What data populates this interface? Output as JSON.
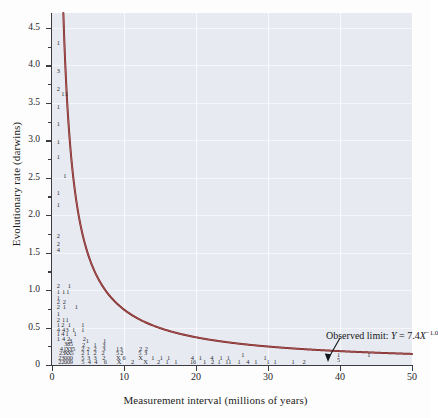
{
  "chart_data": {
    "type": "scatter",
    "title": "",
    "xlabel": "Measurement interval (millions of years)",
    "ylabel": "Evolutionary rate (darwins)",
    "xlim": [
      0,
      50
    ],
    "ylim": [
      0,
      4.7
    ],
    "xticks": [
      0,
      10,
      20,
      30,
      40,
      50
    ],
    "xticklabels": [
      "0",
      "10",
      "20",
      "30",
      "40",
      "50"
    ],
    "yticks": [
      0,
      0.5,
      1.0,
      1.5,
      2.0,
      2.5,
      3.0,
      3.5,
      4.0,
      4.5
    ],
    "yticklabels": [
      "0",
      "0.5",
      "1.0",
      "1.5",
      "2.0",
      "2.5",
      "3.0",
      "3.5",
      "4.0",
      "4.5"
    ],
    "y_minor_ticks": [
      0.25,
      0.75,
      1.25,
      1.75,
      2.25,
      2.75,
      3.25,
      3.75,
      4.25
    ],
    "grid": true,
    "grid_color": "#ffffff",
    "plot_background": "#e7ebf1",
    "curve": {
      "label": "Observed limit",
      "equation": "Y = 7.4X−1.0",
      "coefficient": 7.4,
      "exponent": -1.0,
      "color": "#7b1f1f"
    },
    "annotation": {
      "prefix": "Observed limit: ",
      "var_y": "Y",
      "eq": " = 7.4",
      "var_x": "X",
      "exponent": "−1.0",
      "arrow_target_x": 31.5,
      "arrow_target_y": 0.3
    },
    "point_glyph_note": "Each plotted symbol is a digit giving the number of coincident observations; 'X' denotes 10.",
    "points": [
      {
        "x": 0.9,
        "y": 4.3,
        "n": "1"
      },
      {
        "x": 0.9,
        "y": 3.92,
        "n": "3"
      },
      {
        "x": 0.9,
        "y": 3.68,
        "n": "2"
      },
      {
        "x": 1.5,
        "y": 3.62,
        "n": "1"
      },
      {
        "x": 2.0,
        "y": 3.62,
        "n": "1"
      },
      {
        "x": 0.9,
        "y": 3.45,
        "n": "1"
      },
      {
        "x": 0.9,
        "y": 3.22,
        "n": "1"
      },
      {
        "x": 0.9,
        "y": 2.98,
        "n": "1"
      },
      {
        "x": 0.9,
        "y": 2.78,
        "n": "1"
      },
      {
        "x": 1.8,
        "y": 2.52,
        "n": "1"
      },
      {
        "x": 0.9,
        "y": 2.3,
        "n": "1"
      },
      {
        "x": 0.9,
        "y": 2.13,
        "n": "1"
      },
      {
        "x": 0.9,
        "y": 1.72,
        "n": "2"
      },
      {
        "x": 0.9,
        "y": 1.62,
        "n": "2"
      },
      {
        "x": 0.9,
        "y": 1.53,
        "n": "4"
      },
      {
        "x": 0.9,
        "y": 1.06,
        "n": "2"
      },
      {
        "x": 2.4,
        "y": 1.06,
        "n": "1"
      },
      {
        "x": 0.9,
        "y": 0.98,
        "n": "1"
      },
      {
        "x": 1.6,
        "y": 0.98,
        "n": "1"
      },
      {
        "x": 2.2,
        "y": 0.98,
        "n": "1"
      },
      {
        "x": 0.9,
        "y": 0.9,
        "n": "1"
      },
      {
        "x": 0.9,
        "y": 0.84,
        "n": "2"
      },
      {
        "x": 1.7,
        "y": 0.84,
        "n": "2"
      },
      {
        "x": 0.9,
        "y": 0.78,
        "n": "2"
      },
      {
        "x": 1.7,
        "y": 0.78,
        "n": "1"
      },
      {
        "x": 3.4,
        "y": 0.77,
        "n": "1"
      },
      {
        "x": 0.9,
        "y": 0.68,
        "n": "1"
      },
      {
        "x": 0.9,
        "y": 0.6,
        "n": "2"
      },
      {
        "x": 1.6,
        "y": 0.6,
        "n": "1"
      },
      {
        "x": 2.1,
        "y": 0.6,
        "n": "1"
      },
      {
        "x": 0.9,
        "y": 0.53,
        "n": "1"
      },
      {
        "x": 1.5,
        "y": 0.53,
        "n": "2"
      },
      {
        "x": 2.4,
        "y": 0.53,
        "n": "1"
      },
      {
        "x": 4.3,
        "y": 0.53,
        "n": "1"
      },
      {
        "x": 0.9,
        "y": 0.47,
        "n": "4"
      },
      {
        "x": 1.6,
        "y": 0.47,
        "n": "4"
      },
      {
        "x": 2.1,
        "y": 0.47,
        "n": "3"
      },
      {
        "x": 3.0,
        "y": 0.47,
        "n": "1"
      },
      {
        "x": 4.3,
        "y": 0.47,
        "n": "1"
      },
      {
        "x": 0.9,
        "y": 0.41,
        "n": "1"
      },
      {
        "x": 1.5,
        "y": 0.41,
        "n": "4"
      },
      {
        "x": 2.1,
        "y": 0.41,
        "n": "1"
      },
      {
        "x": 3.2,
        "y": 0.41,
        "n": "1"
      },
      {
        "x": 0.9,
        "y": 0.35,
        "n": "1"
      },
      {
        "x": 1.6,
        "y": 0.35,
        "n": "4"
      },
      {
        "x": 2.3,
        "y": 0.35,
        "n": "2"
      },
      {
        "x": 4.5,
        "y": 0.35,
        "n": "2"
      },
      {
        "x": 2.6,
        "y": 0.32,
        "n": "3"
      },
      {
        "x": 4.9,
        "y": 0.32,
        "n": "1"
      },
      {
        "x": 7.3,
        "y": 0.32,
        "n": "1"
      },
      {
        "x": 1.9,
        "y": 0.28,
        "n": "3"
      },
      {
        "x": 2.3,
        "y": 0.28,
        "n": "8"
      },
      {
        "x": 2.7,
        "y": 0.28,
        "n": "5"
      },
      {
        "x": 4.4,
        "y": 0.27,
        "n": "2"
      },
      {
        "x": 6.0,
        "y": 0.27,
        "n": "1"
      },
      {
        "x": 7.2,
        "y": 0.27,
        "n": "3"
      },
      {
        "x": 1.3,
        "y": 0.22,
        "n": "4"
      },
      {
        "x": 1.8,
        "y": 0.22,
        "n": "1"
      },
      {
        "x": 2.2,
        "y": 0.22,
        "n": "X"
      },
      {
        "x": 2.6,
        "y": 0.22,
        "n": "3"
      },
      {
        "x": 3.0,
        "y": 0.22,
        "n": "5"
      },
      {
        "x": 4.3,
        "y": 0.22,
        "n": "2"
      },
      {
        "x": 5.0,
        "y": 0.22,
        "n": "2"
      },
      {
        "x": 6.0,
        "y": 0.22,
        "n": "2"
      },
      {
        "x": 7.2,
        "y": 0.22,
        "n": "3"
      },
      {
        "x": 9.1,
        "y": 0.22,
        "n": "1"
      },
      {
        "x": 9.6,
        "y": 0.22,
        "n": "3"
      },
      {
        "x": 12.3,
        "y": 0.22,
        "n": "2"
      },
      {
        "x": 13.1,
        "y": 0.22,
        "n": "2"
      },
      {
        "x": 1.2,
        "y": 0.16,
        "n": "2"
      },
      {
        "x": 1.6,
        "y": 0.16,
        "n": "3"
      },
      {
        "x": 2.0,
        "y": 0.16,
        "n": "X"
      },
      {
        "x": 2.4,
        "y": 0.16,
        "n": "X"
      },
      {
        "x": 2.8,
        "y": 0.16,
        "n": "5"
      },
      {
        "x": 4.3,
        "y": 0.16,
        "n": "2"
      },
      {
        "x": 5.0,
        "y": 0.16,
        "n": "1"
      },
      {
        "x": 6.0,
        "y": 0.16,
        "n": "2"
      },
      {
        "x": 7.1,
        "y": 0.16,
        "n": "2"
      },
      {
        "x": 9.1,
        "y": 0.16,
        "n": "5"
      },
      {
        "x": 9.7,
        "y": 0.16,
        "n": "2"
      },
      {
        "x": 12.2,
        "y": 0.16,
        "n": "5"
      },
      {
        "x": 13.0,
        "y": 0.16,
        "n": "3"
      },
      {
        "x": 1.1,
        "y": 0.1,
        "n": "2"
      },
      {
        "x": 1.5,
        "y": 0.1,
        "n": "3"
      },
      {
        "x": 1.9,
        "y": 0.1,
        "n": "0"
      },
      {
        "x": 2.3,
        "y": 0.1,
        "n": "0"
      },
      {
        "x": 2.7,
        "y": 0.1,
        "n": "0"
      },
      {
        "x": 4.3,
        "y": 0.1,
        "n": "5"
      },
      {
        "x": 5.1,
        "y": 0.1,
        "n": "3"
      },
      {
        "x": 6.0,
        "y": 0.1,
        "n": "3"
      },
      {
        "x": 7.2,
        "y": 0.1,
        "n": "2"
      },
      {
        "x": 9.2,
        "y": 0.1,
        "n": "X"
      },
      {
        "x": 10.0,
        "y": 0.1,
        "n": "6"
      },
      {
        "x": 12.3,
        "y": 0.1,
        "n": "X"
      },
      {
        "x": 14.0,
        "y": 0.1,
        "n": "1"
      },
      {
        "x": 1.1,
        "y": 0.04,
        "n": "2"
      },
      {
        "x": 1.5,
        "y": 0.04,
        "n": "2"
      },
      {
        "x": 1.9,
        "y": 0.04,
        "n": "0"
      },
      {
        "x": 2.3,
        "y": 0.04,
        "n": "0"
      },
      {
        "x": 2.7,
        "y": 0.04,
        "n": "9"
      },
      {
        "x": 4.3,
        "y": 0.04,
        "n": "5"
      },
      {
        "x": 5.2,
        "y": 0.04,
        "n": "4"
      },
      {
        "x": 6.1,
        "y": 0.04,
        "n": "4"
      },
      {
        "x": 7.4,
        "y": 0.04,
        "n": "6"
      },
      {
        "x": 9.3,
        "y": 0.04,
        "n": "X"
      },
      {
        "x": 11.2,
        "y": 0.04,
        "n": "2"
      },
      {
        "x": 13.0,
        "y": 0.04,
        "n": "X"
      },
      {
        "x": 14.8,
        "y": 0.04,
        "n": "2"
      },
      {
        "x": 16.0,
        "y": 0.04,
        "n": "1"
      },
      {
        "x": 17.2,
        "y": 0.04,
        "n": "1"
      },
      {
        "x": 15.2,
        "y": 0.1,
        "n": "1"
      },
      {
        "x": 16.2,
        "y": 0.1,
        "n": "1"
      },
      {
        "x": 19.5,
        "y": 0.1,
        "n": "4"
      },
      {
        "x": 20.6,
        "y": 0.1,
        "n": "1"
      },
      {
        "x": 22.2,
        "y": 0.1,
        "n": "4"
      },
      {
        "x": 23.5,
        "y": 0.1,
        "n": "1"
      },
      {
        "x": 24.5,
        "y": 0.1,
        "n": "1"
      },
      {
        "x": 26.5,
        "y": 0.14,
        "n": "1"
      },
      {
        "x": 19.6,
        "y": 0.04,
        "n": "16"
      },
      {
        "x": 21.2,
        "y": 0.04,
        "n": "1"
      },
      {
        "x": 22.3,
        "y": 0.04,
        "n": "2"
      },
      {
        "x": 23.2,
        "y": 0.04,
        "n": "1"
      },
      {
        "x": 24.5,
        "y": 0.04,
        "n": "11"
      },
      {
        "x": 26.0,
        "y": 0.04,
        "n": "1"
      },
      {
        "x": 27.2,
        "y": 0.04,
        "n": "4"
      },
      {
        "x": 28.3,
        "y": 0.04,
        "n": "1"
      },
      {
        "x": 29.6,
        "y": 0.1,
        "n": "1"
      },
      {
        "x": 30.0,
        "y": 0.04,
        "n": "1"
      },
      {
        "x": 31.0,
        "y": 0.04,
        "n": "1"
      },
      {
        "x": 33.5,
        "y": 0.04,
        "n": "1"
      },
      {
        "x": 35.0,
        "y": 0.04,
        "n": "2"
      },
      {
        "x": 39.8,
        "y": 0.14,
        "n": "1"
      },
      {
        "x": 39.8,
        "y": 0.07,
        "n": "5"
      },
      {
        "x": 44.0,
        "y": 0.14,
        "n": "1"
      }
    ]
  }
}
